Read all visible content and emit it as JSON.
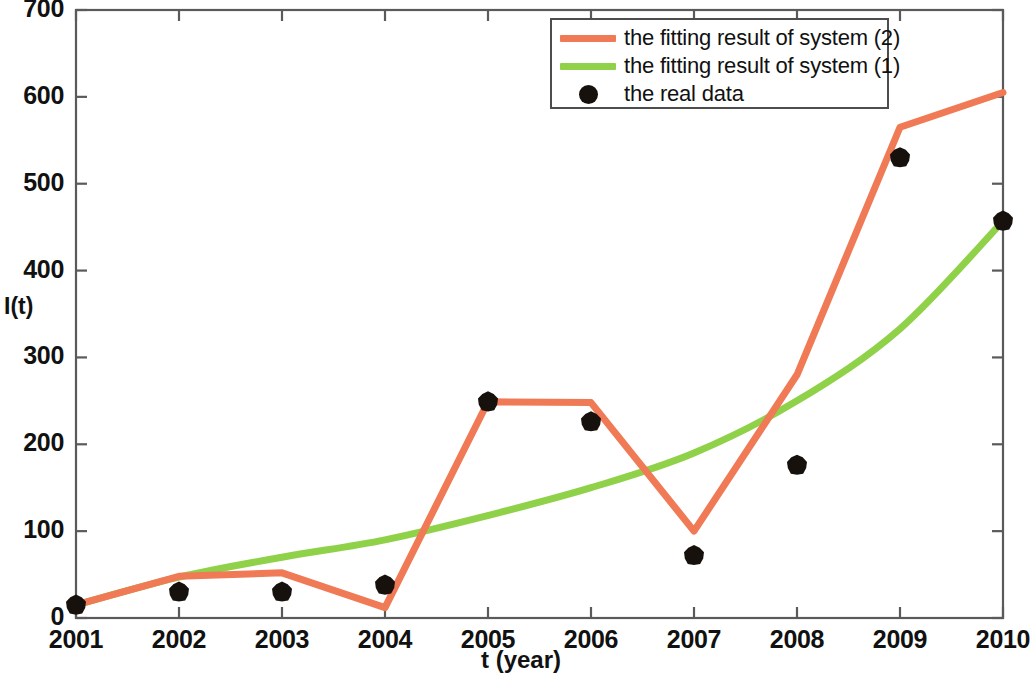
{
  "chart_data": {
    "type": "line",
    "title": "",
    "xlabel": "t (year)",
    "ylabel": "I(t)",
    "x": [
      2001,
      2002,
      2003,
      2004,
      2005,
      2006,
      2007,
      2008,
      2009,
      2010
    ],
    "xticklabels": [
      "2001",
      "2002",
      "2003",
      "2004",
      "2005",
      "2006",
      "2007",
      "2008",
      "2009",
      "2010"
    ],
    "yticklabels": [
      "0",
      "100",
      "200",
      "300",
      "400",
      "500",
      "600",
      "700"
    ],
    "yticks": [
      0,
      100,
      200,
      300,
      400,
      500,
      600,
      700
    ],
    "xlim": [
      2001,
      2010
    ],
    "ylim": [
      0,
      700
    ],
    "grid": false,
    "legend_position": "top-right",
    "series": [
      {
        "name": "the fitting result of system (2)",
        "kind": "line",
        "color": "#F07A55",
        "values": [
          15,
          48,
          52,
          12,
          249,
          248,
          100,
          280,
          565,
          605
        ]
      },
      {
        "name": "the fitting result of system (1)",
        "kind": "line",
        "color": "#8FD24A",
        "values": [
          15,
          47,
          70,
          90,
          118,
          150,
          190,
          250,
          333,
          457
        ]
      },
      {
        "name": "the real data",
        "kind": "scatter",
        "color": "#17110E",
        "values": [
          15,
          30,
          30,
          38,
          249,
          226,
          72,
          176,
          530,
          457
        ]
      }
    ]
  },
  "legend": {
    "items": [
      {
        "label": "the fitting result of system (2)",
        "key": "line",
        "color": "#F07A55"
      },
      {
        "label": "the fitting result of system (1)",
        "key": "line",
        "color": "#8FD24A"
      },
      {
        "label": "the real data",
        "key": "marker",
        "color": "#17110E"
      }
    ]
  },
  "axes": {
    "x_title": "t (year)",
    "y_title": "I(t)"
  }
}
